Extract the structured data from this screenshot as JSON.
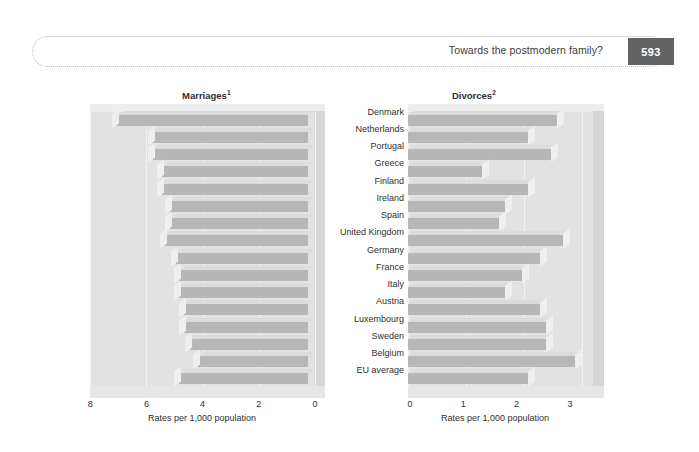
{
  "header": {
    "title": "Towards the postmodern family?",
    "page_number": "593"
  },
  "figure": {
    "left_panel_title": "Marriages",
    "left_panel_superscript": "1",
    "right_panel_title": "Divorces",
    "right_panel_superscript": "2",
    "axis_caption": "Rates per 1,000 population",
    "colors": {
      "bar_face": "#b7b7b7",
      "bar_top": "#dcdcdc",
      "wall": "#e2e2e2",
      "badge": "#636365",
      "text": "#2f2f31"
    }
  },
  "chart_data": [
    {
      "type": "bar",
      "title": "Marriages",
      "orientation": "horizontal",
      "xlabel": "Rates per 1,000 population",
      "ylabel": "",
      "xlim": [
        8,
        0
      ],
      "reversed_axis": true,
      "ticks": [
        8,
        6,
        4,
        2,
        0
      ],
      "grid": true,
      "legend": "none",
      "categories": [
        "Denmark",
        "Netherlands",
        "Portugal",
        "Greece",
        "Finland",
        "Ireland",
        "Spain",
        "United Kingdom",
        "Germany",
        "France",
        "Italy",
        "Austria",
        "Luxembourg",
        "Sweden",
        "Belgium",
        "EU average"
      ],
      "values": [
        6.8,
        5.5,
        5.5,
        5.2,
        5.2,
        4.9,
        4.9,
        5.1,
        4.7,
        4.6,
        4.6,
        4.4,
        4.4,
        4.2,
        3.9,
        4.6
      ]
    },
    {
      "type": "bar",
      "title": "Divorces",
      "orientation": "horizontal",
      "xlabel": "Rates per 1,000 population",
      "ylabel": "",
      "xlim": [
        0,
        3.2
      ],
      "reversed_axis": false,
      "ticks": [
        0,
        1,
        2,
        3
      ],
      "grid": true,
      "legend": "none",
      "categories": [
        "Denmark",
        "Netherlands",
        "Portugal",
        "Greece",
        "Finland",
        "Ireland",
        "Spain",
        "United Kingdom",
        "Germany",
        "France",
        "Italy",
        "Austria",
        "Luxembourg",
        "Sweden",
        "Belgium",
        "EU average"
      ],
      "values": [
        2.6,
        2.1,
        2.5,
        1.3,
        2.1,
        1.7,
        1.6,
        2.7,
        2.3,
        2.0,
        1.7,
        2.3,
        2.4,
        2.4,
        2.9,
        2.1
      ]
    }
  ]
}
